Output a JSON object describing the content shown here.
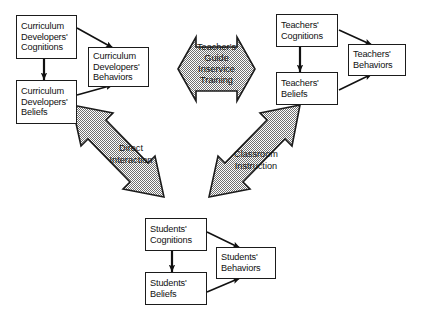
{
  "diagram": {
    "background_color": "#ffffff",
    "shape_fill_color": "#b9b9b9",
    "shape_outline_color": "#1b1b1b",
    "box_fill_color": "#ffffff",
    "box_border_color": "#1b1b1b",
    "text_color": "#111111"
  },
  "nodes": {
    "curriculum_cognitions": {
      "lines": [
        "Curriculum",
        "Developers'",
        "Cognitions"
      ],
      "line1": "Curriculum",
      "line2": "Developers'",
      "line3": "Cognitions"
    },
    "curriculum_beliefs": {
      "lines": [
        "Curriculum",
        "Developers'",
        "Beliefs"
      ],
      "line1": "Curriculum",
      "line2": "Developers'",
      "line3": "Beliefs"
    },
    "curriculum_behaviors": {
      "lines": [
        "Curriculum",
        "Developers'",
        "Behaviors"
      ],
      "line1": "Curriculum",
      "line2": "Developers'",
      "line3": "Behaviors"
    },
    "teachers_cognitions": {
      "lines": [
        "Teachers'",
        "Cognitions"
      ],
      "line1": "Teachers'",
      "line2": "Cognitions"
    },
    "teachers_beliefs": {
      "lines": [
        "Teachers'",
        "Beliefs"
      ],
      "line1": "Teachers'",
      "line2": "Beliefs"
    },
    "teachers_behaviors": {
      "lines": [
        "Teachers'",
        "Behaviors"
      ],
      "line1": "Teachers'",
      "line2": "Behaviors"
    },
    "students_cognitions": {
      "lines": [
        "Students'",
        "Cognitions"
      ],
      "line1": "Students'",
      "line2": "Cognitions"
    },
    "students_beliefs": {
      "lines": [
        "Students'",
        "Beliefs"
      ],
      "line1": "Students'",
      "line2": "Beliefs"
    },
    "students_behaviors": {
      "lines": [
        "Students'",
        "Behaviors"
      ],
      "line1": "Students'",
      "line2": "Behaviors"
    }
  },
  "big_arrows": {
    "center": {
      "name": "teachers-guide-inservice-training",
      "kind": "double-headed-horizontal-arrow",
      "line1": "Teacher's",
      "line2": "Guide",
      "line3": "Inservice",
      "line4": "Training"
    },
    "left": {
      "name": "direct-interaction",
      "kind": "double-headed-diagonal-arrow",
      "line1": "Direct",
      "line2": "Interaction"
    },
    "right": {
      "name": "classroom-instruction",
      "kind": "double-headed-diagonal-arrow",
      "line1": "Classroom",
      "line2": "Instruction"
    }
  },
  "connectors": [
    {
      "from": "curriculum_cognitions",
      "to": "curriculum_behaviors",
      "style": "single-arrow"
    },
    {
      "from": "curriculum_beliefs",
      "to": "curriculum_behaviors",
      "style": "single-arrow"
    },
    {
      "from": "curriculum_cognitions",
      "to": "curriculum_beliefs",
      "style": "double-arrow-vertical"
    },
    {
      "from": "teachers_cognitions",
      "to": "teachers_behaviors",
      "style": "single-arrow"
    },
    {
      "from": "teachers_beliefs",
      "to": "teachers_behaviors",
      "style": "single-arrow"
    },
    {
      "from": "teachers_cognitions",
      "to": "teachers_beliefs",
      "style": "double-arrow-vertical"
    },
    {
      "from": "students_cognitions",
      "to": "students_behaviors",
      "style": "single-arrow"
    },
    {
      "from": "students_beliefs",
      "to": "students_behaviors",
      "style": "single-arrow"
    },
    {
      "from": "students_cognitions",
      "to": "students_beliefs",
      "style": "double-arrow-vertical"
    }
  ]
}
